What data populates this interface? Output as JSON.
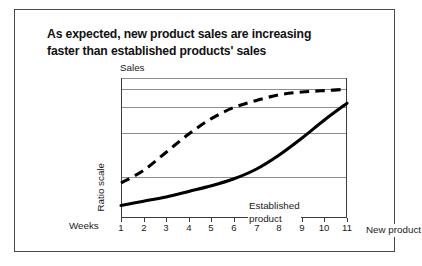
{
  "title": {
    "line1": "As expected, new product sales are increasing",
    "line2": "faster than established products' sales"
  },
  "axes": {
    "y_top_label": "Sales",
    "y_side_label": "Ratio scale",
    "x_label": "Weeks"
  },
  "chart_data": {
    "type": "line",
    "title": "As expected, new product sales are increasing faster than established products' sales",
    "xlabel": "Weeks",
    "ylabel": "Sales",
    "y_scale": "Ratio scale",
    "grid": true,
    "legend_position": "inline-annotations",
    "x": [
      1,
      2,
      3,
      4,
      5,
      6,
      7,
      8,
      9,
      10,
      11
    ],
    "xticklabels": [
      "1",
      "2",
      "3",
      "4",
      "5",
      "6",
      "7",
      "8",
      "9",
      "10",
      "11"
    ],
    "xlim": [
      1,
      11
    ],
    "ylim": [
      0,
      100
    ],
    "gridline_values": [
      100,
      92,
      79,
      61,
      29
    ],
    "series": [
      {
        "name": "Established product",
        "style": "dashed",
        "color": "#000000",
        "values": [
          25,
          34,
          47,
          60,
          71,
          79,
          84,
          88,
          90,
          91,
          92
        ]
      },
      {
        "name": "New product",
        "style": "solid",
        "color": "#000000",
        "values": [
          9,
          12,
          15,
          19,
          23,
          28,
          35,
          45,
          57,
          70,
          82
        ]
      }
    ],
    "annotations": [
      {
        "text": "Established product",
        "series": "Established product"
      },
      {
        "text": "New product",
        "series": "New product"
      }
    ]
  },
  "ticks": [
    {
      "label": "1"
    },
    {
      "label": "2"
    },
    {
      "label": "3"
    },
    {
      "label": "4"
    },
    {
      "label": "5"
    },
    {
      "label": "6"
    },
    {
      "label": "7"
    },
    {
      "label": "8"
    },
    {
      "label": "9"
    },
    {
      "label": "10"
    },
    {
      "label": "11"
    }
  ],
  "colors": {
    "frame": "#3b3b3b",
    "grid": "#8d8d8d",
    "curve": "#000000",
    "border": "#4a4a4a"
  }
}
